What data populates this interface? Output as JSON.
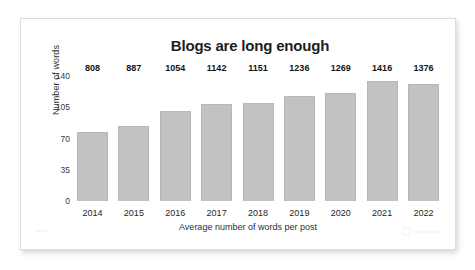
{
  "card": {
    "watermark_left": "•••••",
    "watermark_right": "••••••••••",
    "watermark_icon": "circle-logo-icon"
  },
  "chart_data": {
    "type": "bar",
    "title": "Blogs are long enough",
    "xlabel": "Average number of words per post",
    "ylabel": "Number of words",
    "categories": [
      "2014",
      "2015",
      "2016",
      "2017",
      "2018",
      "2019",
      "2020",
      "2021",
      "2022"
    ],
    "values": [
      808,
      887,
      1054,
      1142,
      1151,
      1236,
      1269,
      1416,
      1376
    ],
    "labels": [
      "808",
      "887",
      "1054",
      "1142",
      "1151",
      "1236",
      "1269",
      "1416",
      "1376"
    ],
    "yticks": [
      0,
      35,
      70,
      105,
      140
    ],
    "ytick_labels": [
      "0",
      "35",
      "70",
      "105",
      "140"
    ],
    "ylim": [
      0,
      140
    ],
    "value_scale_divisor": 10.5,
    "grid": false,
    "legend": false,
    "bar_color": "#c2c2c2",
    "text_color": "#141414"
  }
}
